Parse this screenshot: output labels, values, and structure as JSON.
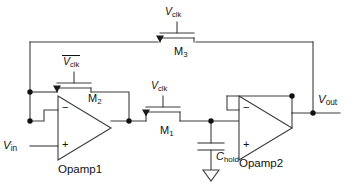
{
  "diagram": {
    "stroke_color": "#3c3c3c",
    "text_color": "#111111",
    "background": "#ffffff"
  },
  "ports": {
    "input_label": "V",
    "input_sub": "in",
    "output_label": "V",
    "output_sub": "out"
  },
  "clocks": {
    "m3_clock": "V",
    "m3_clock_sub": "clk",
    "m2_clock": "V",
    "m2_clock_sub": "clk",
    "m2_clock_is_complement": true,
    "m1_clock": "V",
    "m1_clock_sub": "clk"
  },
  "devices": [
    {
      "name": "M3",
      "label": "M",
      "sub": "3",
      "type": "mos-switch",
      "gate_signal": "V_clk"
    },
    {
      "name": "M2",
      "label": "M",
      "sub": "2",
      "type": "mos-switch",
      "gate_signal": "V_clk_bar"
    },
    {
      "name": "M1",
      "label": "M",
      "sub": "1",
      "type": "mos-switch",
      "gate_signal": "V_clk"
    }
  ],
  "opamps": [
    {
      "name": "Opamp1",
      "label": "Opamp1",
      "minus": "−",
      "plus": "+"
    },
    {
      "name": "Opamp2",
      "label": "Opamp2",
      "minus": "−",
      "plus": "+"
    }
  ],
  "capacitor": {
    "label": "C",
    "sub": "hold",
    "ground": "ground-symbol"
  }
}
